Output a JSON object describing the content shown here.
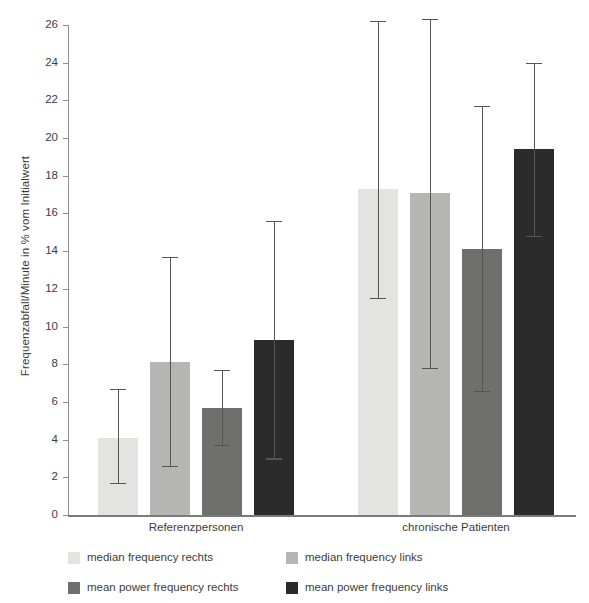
{
  "chart_data": {
    "type": "bar",
    "title": "",
    "xlabel": "",
    "ylabel": "Frequenzabfall/Minute in % vom Initialwert",
    "ylim": [
      0,
      26
    ],
    "yticks": [
      0,
      2,
      4,
      6,
      8,
      10,
      12,
      14,
      16,
      18,
      20,
      22,
      24,
      26
    ],
    "grid": false,
    "legend_position": "bottom",
    "categories": [
      "Referenzpersonen",
      "chronische Patienten"
    ],
    "series": [
      {
        "name": "median frequency rechts",
        "color": "#e3e3e1",
        "values": [
          4.1,
          17.3
        ],
        "err_low": [
          1.7,
          11.5
        ],
        "err_high": [
          6.7,
          26.2
        ]
      },
      {
        "name": "median frequency links",
        "color": "#b5b5b3",
        "values": [
          8.1,
          17.1
        ],
        "err_low": [
          2.6,
          7.8
        ],
        "err_high": [
          13.7,
          26.3
        ]
      },
      {
        "name": "mean power frequency rechts",
        "color": "#6f6f6e",
        "values": [
          5.7,
          14.1
        ],
        "err_low": [
          3.7,
          6.6
        ],
        "err_high": [
          7.7,
          21.7
        ]
      },
      {
        "name": "mean power frequency links",
        "color": "#2b2b2b",
        "values": [
          9.3,
          19.4
        ],
        "err_low": [
          3.0,
          14.8
        ],
        "err_high": [
          15.6,
          24.0
        ]
      }
    ]
  },
  "legend": {
    "items": [
      {
        "label": "median frequency rechts",
        "color": "#e3e3e1"
      },
      {
        "label": "median frequency links",
        "color": "#b5b5b3"
      },
      {
        "label": "mean power frequency rechts",
        "color": "#6f6f6e"
      },
      {
        "label": "mean power frequency links",
        "color": "#2b2b2b"
      }
    ]
  }
}
